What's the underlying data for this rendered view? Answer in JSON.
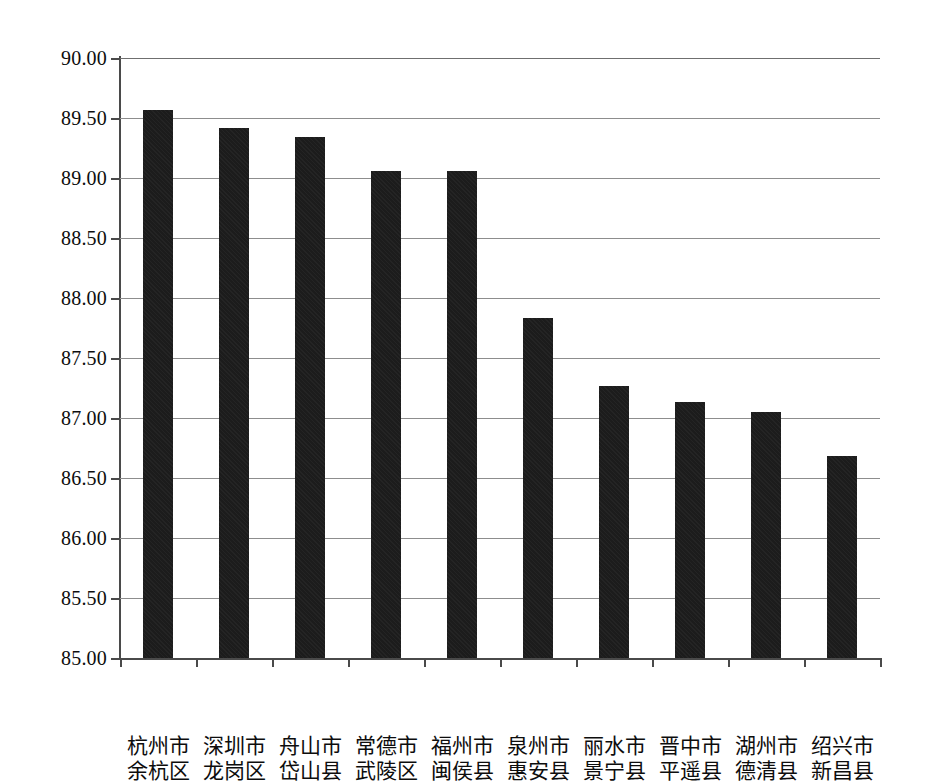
{
  "chart_data": {
    "type": "bar",
    "title": "",
    "subtitle": "",
    "xlabel": "",
    "ylabel": "",
    "ylim": [
      85.0,
      90.0
    ],
    "ytick_step": 0.5,
    "ytick_labels": [
      "90.00",
      "89.50",
      "89.00",
      "88.50",
      "88.00",
      "87.50",
      "87.00",
      "86.50",
      "86.00",
      "85.50",
      "85.00"
    ],
    "ytick_values": [
      90.0,
      89.5,
      89.0,
      88.5,
      88.0,
      87.5,
      87.0,
      86.5,
      86.0,
      85.5,
      85.0
    ],
    "grid": "horizontal",
    "legend": "none",
    "bar_color": "#1c1c1c",
    "categories": [
      "杭州市余杭区",
      "深圳市龙岗区",
      "舟山市岱山县",
      "常德市武陵区",
      "福州市闽侯县",
      "泉州市惠安县",
      "丽水市景宁县",
      "晋中市平遥县",
      "湖州市德清县",
      "绍兴市新昌县"
    ],
    "category_lines": [
      [
        "杭州市",
        "余杭区"
      ],
      [
        "深圳市",
        "龙岗区"
      ],
      [
        "舟山市",
        "岱山县"
      ],
      [
        "常德市",
        "武陵区"
      ],
      [
        "福州市",
        "闽侯县"
      ],
      [
        "泉州市",
        "惠安县"
      ],
      [
        "丽水市",
        "景宁县"
      ],
      [
        "晋中市",
        "平遥县"
      ],
      [
        "湖州市",
        "德清县"
      ],
      [
        "绍兴市",
        "新昌县"
      ]
    ],
    "values": [
      89.57,
      89.42,
      89.34,
      89.06,
      89.06,
      87.83,
      87.27,
      87.13,
      87.05,
      86.68
    ]
  }
}
